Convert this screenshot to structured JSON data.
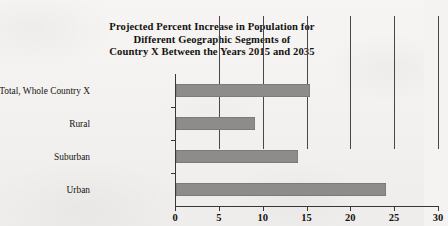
{
  "chart_data": {
    "type": "bar",
    "orientation": "horizontal",
    "title": "Projected Percent Increase in Population for Different Geographic Segments of Country X Between the Years 2015 and 2035",
    "title_lines": [
      "Projected Percent Increase in Population for",
      "Different Geographic Segments of",
      "Country X Between the Years 2015 and 2035"
    ],
    "categories": [
      "Total, Whole Country X",
      "Rural",
      "Suburban",
      "Urban"
    ],
    "values": [
      15.4,
      9,
      14,
      24
    ],
    "xlabel": "",
    "ylabel": "",
    "xlim": [
      0,
      30
    ],
    "xticks": [
      0,
      5,
      10,
      15,
      20,
      25,
      30
    ],
    "xtick_labels": [
      "0",
      "5",
      "10",
      "15",
      "20",
      "25",
      "30"
    ],
    "grid": true,
    "grid_axis": "x",
    "legend": false,
    "bar_color": "#8d8c8a",
    "axis_color": "#3a3733",
    "background_color": "#f4f3f1"
  }
}
